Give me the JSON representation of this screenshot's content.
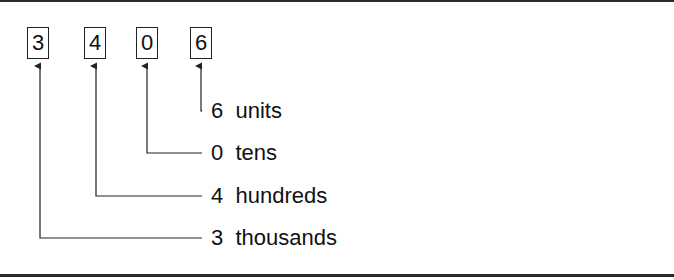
{
  "diagram": {
    "number": "3406",
    "digits": [
      {
        "value": "3",
        "place": "thousands",
        "label": "3  thousands"
      },
      {
        "value": "4",
        "place": "hundreds",
        "label": "4  hundreds"
      },
      {
        "value": "0",
        "place": "tens",
        "label": "0  tens"
      },
      {
        "value": "6",
        "place": "units",
        "label": "6  units"
      }
    ]
  }
}
